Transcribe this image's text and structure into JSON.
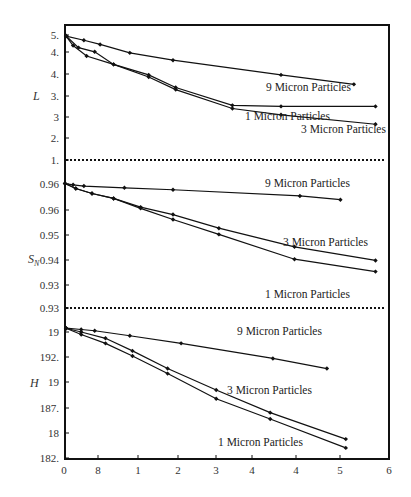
{
  "chart_data": [
    {
      "type": "line",
      "panel": "top",
      "ylabel": "L",
      "yticks": [
        "5.",
        "4.",
        "4.",
        "3.",
        "3",
        "2.",
        "1."
      ],
      "xticks": [
        "0",
        "8",
        "1",
        "2",
        "3",
        "4",
        "4",
        "5",
        "6"
      ],
      "reference_line": {
        "label": "1.",
        "style": "dotted"
      },
      "series": [
        {
          "name": "9 Micron Particles",
          "points": [
            [
              0.02,
              0.05
            ],
            [
              0.35,
              0.25
            ],
            [
              0.65,
              0.45
            ],
            [
              1.2,
              0.85
            ],
            [
              2.0,
              1.2
            ],
            [
              4.0,
              1.9
            ],
            [
              5.35,
              2.35
            ]
          ]
        },
        {
          "name": "1 Micron Particles",
          "points": [
            [
              0.02,
              0.05
            ],
            [
              0.25,
              0.6
            ],
            [
              0.55,
              0.8
            ],
            [
              0.9,
              1.4
            ],
            [
              1.55,
              1.9
            ],
            [
              2.05,
              2.5
            ],
            [
              3.1,
              3.35
            ],
            [
              4.0,
              3.4
            ],
            [
              5.75,
              3.4
            ]
          ]
        },
        {
          "name": "3 Micron Particles",
          "points": [
            [
              0.02,
              0.05
            ],
            [
              0.15,
              0.5
            ],
            [
              0.4,
              1.0
            ],
            [
              0.9,
              1.4
            ],
            [
              1.55,
              2.0
            ],
            [
              2.05,
              2.6
            ],
            [
              3.1,
              3.5
            ],
            [
              4.0,
              3.8
            ],
            [
              5.75,
              4.25
            ]
          ]
        }
      ]
    },
    {
      "type": "line",
      "panel": "middle",
      "ylabel": "S_N",
      "yticks": [
        "1.",
        "0.96",
        "0.96",
        "0.95",
        "0.94",
        "0.93",
        "0.93"
      ],
      "reference_lines": [
        {
          "label": "1.",
          "style": "dotted"
        },
        {
          "label": "0.93",
          "style": "dotted"
        }
      ],
      "series": [
        {
          "name": "9 Micron Particles",
          "points": [
            [
              0.0,
              0.95
            ],
            [
              0.15,
              1.0
            ],
            [
              0.35,
              1.05
            ],
            [
              1.1,
              1.12
            ],
            [
              2.0,
              1.2
            ],
            [
              4.35,
              1.45
            ],
            [
              5.1,
              1.6
            ]
          ]
        },
        {
          "name": "3 Micron Particles",
          "points": [
            [
              0.0,
              0.95
            ],
            [
              0.2,
              1.15
            ],
            [
              0.5,
              1.35
            ],
            [
              0.9,
              1.55
            ],
            [
              1.4,
              1.9
            ],
            [
              2.0,
              2.2
            ],
            [
              2.85,
              2.75
            ],
            [
              4.25,
              3.5
            ],
            [
              5.75,
              4.05
            ]
          ]
        },
        {
          "name": "1 Micron Particles",
          "points": [
            [
              0.0,
              0.95
            ],
            [
              0.2,
              1.15
            ],
            [
              0.5,
              1.35
            ],
            [
              0.9,
              1.55
            ],
            [
              1.4,
              1.95
            ],
            [
              2.0,
              2.4
            ],
            [
              2.85,
              3.0
            ],
            [
              4.25,
              4.0
            ],
            [
              5.75,
              4.5
            ]
          ]
        }
      ]
    },
    {
      "type": "line",
      "panel": "bottom",
      "ylabel": "H",
      "yticks": [
        "19",
        "192.",
        "19",
        "187.",
        "18",
        "182."
      ],
      "series": [
        {
          "name": "9 Micron Particles",
          "points": [
            [
              0.02,
              -0.15
            ],
            [
              0.3,
              -0.1
            ],
            [
              0.55,
              -0.05
            ],
            [
              1.2,
              0.15
            ],
            [
              2.15,
              0.45
            ],
            [
              3.85,
              1.05
            ],
            [
              4.85,
              1.45
            ]
          ]
        },
        {
          "name": "3 Micron Particles",
          "points": [
            [
              0.02,
              -0.15
            ],
            [
              0.3,
              0.0
            ],
            [
              0.75,
              0.25
            ],
            [
              1.25,
              0.75
            ],
            [
              1.9,
              1.45
            ],
            [
              2.8,
              2.3
            ],
            [
              3.8,
              3.2
            ],
            [
              5.2,
              4.25
            ]
          ]
        },
        {
          "name": "1 Micron Particles",
          "points": [
            [
              0.02,
              -0.15
            ],
            [
              0.3,
              0.1
            ],
            [
              0.75,
              0.45
            ],
            [
              1.25,
              0.95
            ],
            [
              1.9,
              1.65
            ],
            [
              2.8,
              2.65
            ],
            [
              3.8,
              3.45
            ],
            [
              5.2,
              4.6
            ]
          ]
        }
      ]
    }
  ],
  "x_axis": {
    "ticks": [
      "0",
      "8",
      "1",
      "2",
      "3",
      "4",
      "4",
      "5",
      "6"
    ]
  },
  "labels": {
    "top": [
      {
        "text": "9 Micron Particles",
        "x": 266,
        "y": 91
      },
      {
        "text": "1 Micron Particles",
        "x": 245,
        "y": 120
      },
      {
        "text": "3 Micron Particles",
        "x": 301,
        "y": 133
      }
    ],
    "middle": [
      {
        "text": "9 Micron Particles",
        "x": 265,
        "y": 187
      },
      {
        "text": "3 Micron Particles",
        "x": 283,
        "y": 246
      },
      {
        "text": "1 Micron Particles",
        "x": 265,
        "y": 298
      }
    ],
    "bottom": [
      {
        "text": "9 Micron Particles",
        "x": 237,
        "y": 335
      },
      {
        "text": "3 Micron Particles",
        "x": 227,
        "y": 394
      },
      {
        "text": "1 Micron Particles",
        "x": 218,
        "y": 446
      }
    ]
  }
}
